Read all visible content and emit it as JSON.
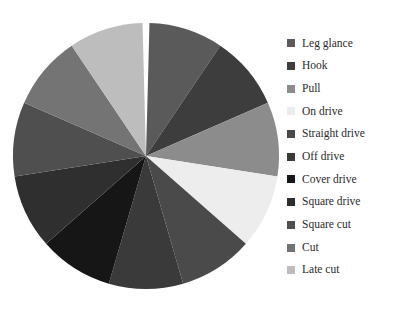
{
  "chart_data": {
    "type": "pie",
    "title": "",
    "subtitle": "",
    "xlabel": "",
    "ylabel": "",
    "legend_position": "right",
    "grid": false,
    "start_angle_deg": 91,
    "gap_deg": 3,
    "center": {
      "x": 146,
      "y": 156
    },
    "radius": 133,
    "categories": [
      "Leg glance",
      "Hook",
      "Pull",
      "On drive",
      "Straight drive",
      "Off drive",
      "Cover drive",
      "Square drive",
      "Square cut",
      "Cut",
      "Late cut"
    ],
    "values": [
      9.1,
      9.1,
      9.1,
      9.1,
      9.1,
      9.1,
      9.1,
      9.1,
      9.1,
      9.1,
      9.1
    ],
    "slice_angles_deg": [
      32.5,
      32.5,
      32.5,
      32.5,
      32.5,
      32.5,
      32.5,
      32.5,
      32.5,
      32.5,
      32.5
    ],
    "colors": [
      "#5a5a5a",
      "#3d3d3d",
      "#8c8c8c",
      "#ededed",
      "#4a4a4a",
      "#3a3a3a",
      "#161616",
      "#2f2f2f",
      "#4f4f4f",
      "#747474",
      "#bdbdbd"
    ],
    "slices": [
      {
        "label": "Leg glance",
        "value": 9.1,
        "color": "#5a5a5a"
      },
      {
        "label": "Hook",
        "value": 9.1,
        "color": "#3d3d3d"
      },
      {
        "label": "Pull",
        "value": 9.1,
        "color": "#8c8c8c"
      },
      {
        "label": "On drive",
        "value": 9.1,
        "color": "#ededed"
      },
      {
        "label": "Straight drive",
        "value": 9.1,
        "color": "#4a4a4a"
      },
      {
        "label": "Off drive",
        "value": 9.1,
        "color": "#3a3a3a"
      },
      {
        "label": "Cover drive",
        "value": 9.1,
        "color": "#161616"
      },
      {
        "label": "Square drive",
        "value": 9.1,
        "color": "#2f2f2f"
      },
      {
        "label": "Square cut",
        "value": 9.1,
        "color": "#4f4f4f"
      },
      {
        "label": "Cut",
        "value": 9.1,
        "color": "#747474"
      },
      {
        "label": "Late cut",
        "value": 9.1,
        "color": "#bdbdbd"
      }
    ]
  },
  "legend": {
    "items": [
      {
        "label": "Leg glance",
        "color": "#5a5a5a"
      },
      {
        "label": "Hook",
        "color": "#3d3d3d"
      },
      {
        "label": "Pull",
        "color": "#8c8c8c"
      },
      {
        "label": "On drive",
        "color": "#ededed"
      },
      {
        "label": "Straight drive",
        "color": "#4a4a4a"
      },
      {
        "label": "Off drive",
        "color": "#3a3a3a"
      },
      {
        "label": "Cover drive",
        "color": "#161616"
      },
      {
        "label": "Square drive",
        "color": "#2f2f2f"
      },
      {
        "label": "Square cut",
        "color": "#4f4f4f"
      },
      {
        "label": "Cut",
        "color": "#747474"
      },
      {
        "label": "Late cut",
        "color": "#bdbdbd"
      }
    ]
  },
  "colors": {
    "background": "#ffffff",
    "text": "#2b2b2b"
  }
}
